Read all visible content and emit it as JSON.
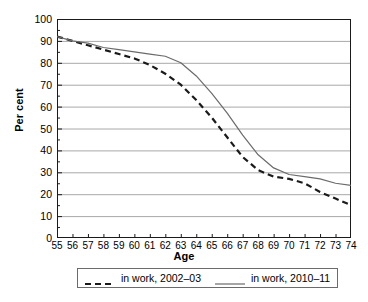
{
  "chart_data": {
    "type": "line",
    "title": "",
    "xlabel": "Age",
    "ylabel": "Per cent",
    "xlim": [
      55,
      74
    ],
    "ylim": [
      0,
      100
    ],
    "ytick_step": 10,
    "grid": "horizontal",
    "legend_position": "bottom",
    "x": [
      55,
      56,
      57,
      58,
      59,
      60,
      61,
      62,
      63,
      64,
      65,
      66,
      67,
      68,
      69,
      70,
      71,
      72,
      73,
      74
    ],
    "yticks": [
      0,
      10,
      20,
      30,
      40,
      50,
      60,
      70,
      80,
      90,
      100
    ],
    "xticklabels": [
      "55",
      "56",
      "57",
      "58",
      "59",
      "60",
      "61",
      "62",
      "63",
      "64",
      "65",
      "66",
      "67",
      "68",
      "69",
      "70",
      "71",
      "72",
      "73",
      "74"
    ],
    "series": [
      {
        "name": "in work, 2002–03",
        "style": "dashed",
        "color": "#1a1a1a",
        "values": [
          92,
          90,
          88,
          86,
          84,
          82,
          79,
          75,
          70,
          63,
          55,
          46,
          37,
          31,
          28,
          27,
          25,
          21,
          18,
          15
        ]
      },
      {
        "name": "in work, 2010–11",
        "style": "solid",
        "color": "#6b6b6b",
        "values": [
          92,
          90,
          89,
          87,
          86,
          85,
          84,
          83,
          80,
          74,
          66,
          57,
          47,
          38,
          32,
          29,
          28,
          27,
          25,
          24
        ]
      }
    ]
  },
  "axes": {
    "ylabel": "Per cent",
    "xlabel": "Age"
  },
  "legend": {
    "items": [
      {
        "label": "in work, 2002–03",
        "style": "dashed"
      },
      {
        "label": "in work, 2010–11",
        "style": "solid"
      }
    ]
  },
  "colors": {
    "dashed_series": "#1a1a1a",
    "solid_series": "#6b6b6b",
    "gridline": "#a8a8a8",
    "axis": "#1a1a1a",
    "background": "#ffffff"
  }
}
